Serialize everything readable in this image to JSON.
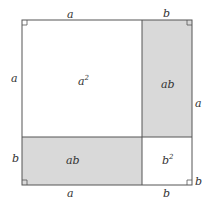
{
  "diagram": {
    "title": "",
    "colors": {
      "line": "#555555",
      "shade": "#d9d9d9",
      "background": "#ffffff",
      "text": "#333333"
    },
    "regions": {
      "a_squared": {
        "label": "a",
        "sup": "2"
      },
      "ab_right": {
        "label": "ab"
      },
      "ab_bottom": {
        "label": "ab"
      },
      "b_squared": {
        "label": "b",
        "sup": "2"
      }
    },
    "edge_labels": {
      "top_a": "a",
      "top_b": "b",
      "left_a": "a",
      "left_b": "b",
      "right_a": "a",
      "right_b": "b",
      "bottom_a": "a",
      "bottom_b": "b"
    }
  }
}
